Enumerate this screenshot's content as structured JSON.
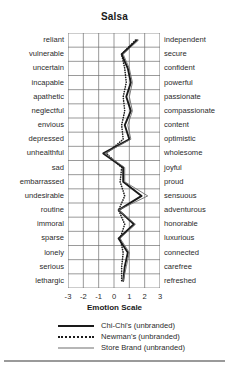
{
  "chart": {
    "title": "Salsa",
    "xlabel": "Emotion Scale"
  },
  "axis": {
    "ticks": [
      "-3",
      "-2",
      "-1",
      "0",
      "1",
      "2",
      "3"
    ]
  },
  "legend": {
    "items": [
      {
        "label": "Chi-Chi's (unbranded)",
        "style": "solid-thick",
        "color": "#1a1a1a"
      },
      {
        "label": "Newman's (unbranded)",
        "style": "dotted",
        "color": "#1a1a1a"
      },
      {
        "label": "Store Brand (unbranded)",
        "style": "solid-thin",
        "color": "#6f6f6f"
      }
    ]
  },
  "chart_data": {
    "type": "line",
    "title": "Salsa",
    "xlabel": "Emotion Scale",
    "ylabel": "",
    "xlim": [
      -3,
      3
    ],
    "grid": true,
    "orientation": "horizontal-profile",
    "legend_position": "bottom",
    "left_labels": [
      "reliant",
      "vulnerable",
      "uncertain",
      "incapable",
      "apathetic",
      "neglectful",
      "envious",
      "depressed",
      "unhealthful",
      "sad",
      "embarrassed",
      "undesirable",
      "routine",
      "immoral",
      "sparse",
      "lonely",
      "serious",
      "lethargic"
    ],
    "right_labels": [
      "independent",
      "secure",
      "confident",
      "powerful",
      "passionate",
      "compassionate",
      "content",
      "optimistic",
      "wholesome",
      "joyful",
      "proud",
      "sensuous",
      "adventurous",
      "honorable",
      "luxurious",
      "connected",
      "carefree",
      "refreshed"
    ],
    "categories": [
      "reliant/independent",
      "vulnerable/secure",
      "uncertain/confident",
      "incapable/powerful",
      "apathetic/passionate",
      "neglectful/compassionate",
      "envious/content",
      "depressed/optimistic",
      "unhealthful/wholesome",
      "sad/joyful",
      "embarrassed/proud",
      "undesirable/sensuous",
      "routine/adventurous",
      "immoral/honorable",
      "sparse/luxurious",
      "lonely/connected",
      "serious/carefree",
      "lethargic/refreshed"
    ],
    "series": [
      {
        "name": "Chi-Chi's (unbranded)",
        "style": "solid-thick",
        "color": "#1a1a1a",
        "values": [
          1.5,
          0.5,
          0.9,
          1.1,
          0.8,
          1.1,
          0.7,
          1.0,
          -0.7,
          0.6,
          0.6,
          1.8,
          0.3,
          1.3,
          0.3,
          0.9,
          0.7,
          0.6
        ]
      },
      {
        "name": "Newman's (unbranded)",
        "style": "dotted",
        "color": "#1a1a1a",
        "values": [
          1.4,
          0.5,
          0.7,
          0.8,
          0.6,
          0.7,
          0.5,
          0.6,
          -0.5,
          0.5,
          0.4,
          0.7,
          0.3,
          0.7,
          0.4,
          0.6,
          0.5,
          0.5
        ]
      },
      {
        "name": "Store Brand (unbranded)",
        "style": "solid-thin",
        "color": "#6f6f6f",
        "values": [
          1.6,
          0.6,
          1.0,
          1.2,
          1.0,
          1.2,
          0.9,
          1.1,
          -0.6,
          0.7,
          0.7,
          2.2,
          0.3,
          1.4,
          0.4,
          1.0,
          0.8,
          0.6
        ]
      }
    ]
  }
}
